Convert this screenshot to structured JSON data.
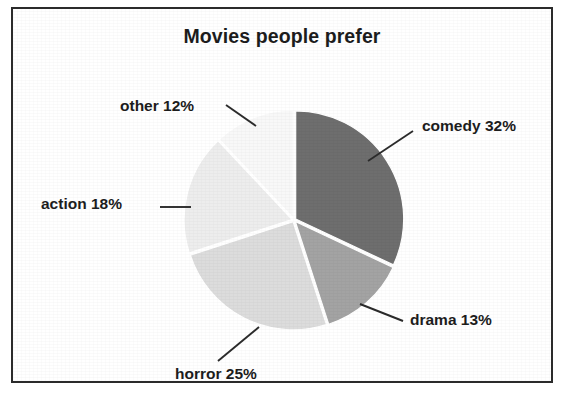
{
  "figure": {
    "title": "Movies people prefer",
    "border_color": "#2b2b2b",
    "background": "#ffffff"
  },
  "chart_data": {
    "type": "pie",
    "title": "Movies people prefer",
    "xlabel": "",
    "ylabel": "",
    "legend": "none",
    "grid": false,
    "labels_inline": true,
    "start_angle_deg": 0,
    "direction": "clockwise",
    "categories": [
      "comedy",
      "drama",
      "horror",
      "action",
      "other"
    ],
    "values": [
      32,
      13,
      25,
      18,
      12
    ],
    "units": "percent",
    "total": 100,
    "slices": [
      {
        "name": "comedy",
        "value": 32,
        "label": "comedy 32%",
        "color": "#6e6e6e",
        "start_deg": 0,
        "end_deg": 115.2
      },
      {
        "name": "drama",
        "value": 13,
        "label": "drama 13%",
        "color": "#a3a3a3",
        "start_deg": 115.2,
        "end_deg": 162.0
      },
      {
        "name": "horror",
        "value": 25,
        "label": "horror 25%",
        "color": "#dcdcdc",
        "start_deg": 162.0,
        "end_deg": 252.0
      },
      {
        "name": "action",
        "value": 18,
        "label": "action 18%",
        "color": "#ededed",
        "start_deg": 252.0,
        "end_deg": 316.8
      },
      {
        "name": "other",
        "value": 12,
        "label": "other 12%",
        "color": "#f8f8f8",
        "start_deg": 316.8,
        "end_deg": 360.0
      }
    ]
  }
}
